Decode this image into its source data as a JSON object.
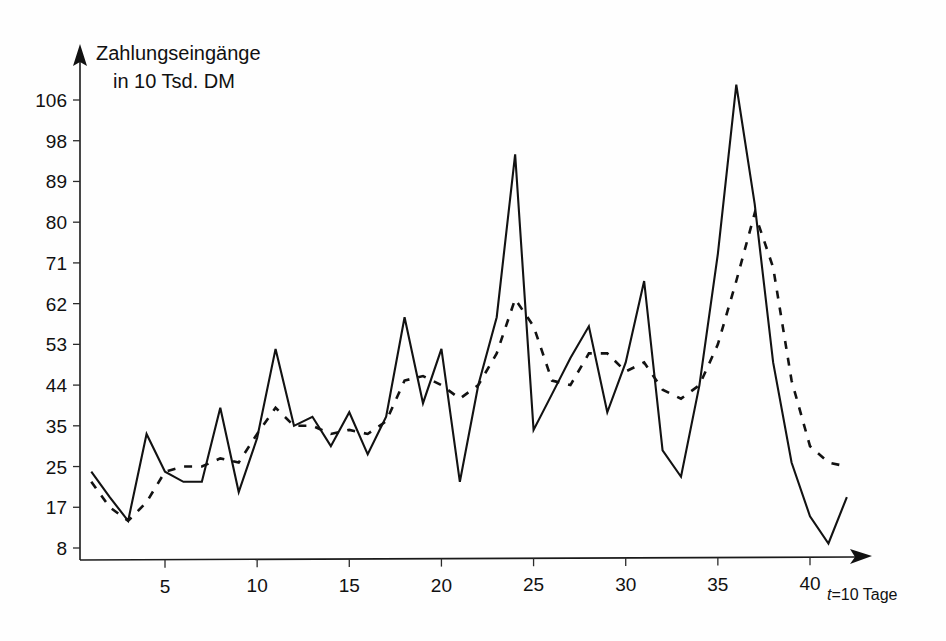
{
  "chart_data": {
    "type": "line",
    "title": "Zahlungseingänge",
    "subtitle": "in 10 Tsd. DM",
    "ylabel": "Zahlungseingänge in 10 Tsd. DM",
    "xlabel": "t=10 Tage",
    "xlabel_prefix": "t",
    "xlabel_rest": "=10  Tage",
    "grid": false,
    "legend": "none",
    "xlim": [
      1,
      43
    ],
    "ylim": [
      8,
      110
    ],
    "y_ticks": [
      8,
      17,
      25,
      35,
      44,
      53,
      62,
      71,
      80,
      89,
      98,
      106
    ],
    "y_tick_labels": [
      "8",
      "17",
      "25",
      "35",
      "44",
      "53",
      "62",
      "71",
      "80",
      "89",
      "98",
      "106"
    ],
    "x_ticks": [
      5,
      10,
      15,
      20,
      25,
      30,
      35,
      40
    ],
    "x_tick_labels": [
      "5",
      "10",
      "15",
      "20",
      "25",
      "30",
      "35",
      "40"
    ],
    "x": [
      1,
      2,
      3,
      4,
      5,
      6,
      7,
      8,
      9,
      10,
      11,
      12,
      13,
      14,
      15,
      16,
      17,
      18,
      19,
      20,
      21,
      22,
      23,
      24,
      25,
      26,
      27,
      28,
      29,
      30,
      31,
      32,
      33,
      34,
      35,
      36,
      37,
      38,
      39,
      40,
      41,
      42
    ],
    "series": [
      {
        "name": "Zahlungseingänge (Istwerte)",
        "style": "solid",
        "values": [
          24,
          19,
          14,
          33,
          24,
          22,
          22,
          39,
          20,
          32,
          52,
          35,
          37,
          30,
          38,
          28,
          37,
          59,
          40,
          52,
          22,
          44,
          59,
          95,
          34,
          42,
          50,
          57,
          38,
          49,
          67,
          29,
          23,
          44,
          73,
          109,
          84,
          49,
          26,
          15,
          9,
          19
        ]
      },
      {
        "name": "Zahlungseingänge (geglättet / gleitender Durchschnitt)",
        "style": "dashed",
        "values": [
          22,
          17,
          14,
          18,
          24,
          25,
          25,
          27,
          26,
          33,
          39,
          35,
          35,
          33,
          34,
          33,
          36,
          45,
          46,
          44,
          41,
          44,
          51,
          63,
          57,
          45,
          44,
          51,
          51,
          47,
          49,
          43,
          41,
          44,
          53,
          67,
          82,
          70,
          45,
          30,
          26,
          25
        ]
      }
    ]
  }
}
